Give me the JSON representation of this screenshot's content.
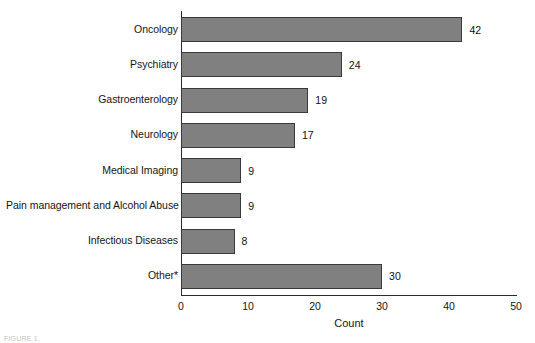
{
  "chart_data": {
    "type": "bar",
    "orientation": "horizontal",
    "title": "",
    "xlabel": "Count",
    "ylabel": "",
    "xlim": [
      0,
      50
    ],
    "xticks": [
      0,
      10,
      20,
      30,
      40,
      50
    ],
    "grid": false,
    "legend": null,
    "bar_color": "#808080",
    "bar_border_color": "#3a3a3a",
    "categories": [
      "Oncology",
      "Psychiatry",
      "Gastroenterology",
      "Neurology",
      "Medical Imaging",
      "Pain management and Alcohol Abuse",
      "Infectious Diseases",
      "Other*"
    ],
    "values": [
      42,
      24,
      19,
      17,
      9,
      9,
      8,
      30
    ],
    "data_labels": [
      "42",
      "24",
      "19",
      "17",
      "9",
      "9",
      "8",
      "30"
    ]
  },
  "axis": {
    "x_title": "Count",
    "tick_labels": [
      "0",
      "10",
      "20",
      "30",
      "40",
      "50"
    ]
  },
  "caption": {
    "fragment": "FIGURE 1."
  }
}
